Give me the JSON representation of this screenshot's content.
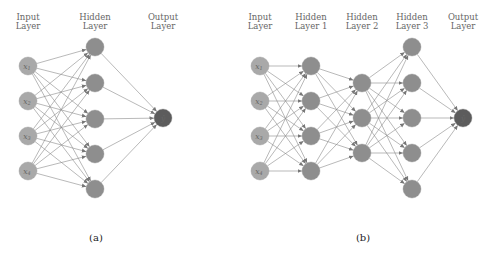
{
  "figure": {
    "panels": [
      {
        "id": "a",
        "caption": "(a)",
        "layers": [
          {
            "name": "input",
            "label_line1": "Input",
            "label_line2": "Layer",
            "x": 28,
            "ys": [
              66,
              101,
              136,
              171
            ],
            "color": "#a9a9a9",
            "node_labels": [
              "x1",
              "x2",
              "x3",
              "x4"
            ]
          },
          {
            "name": "hidden",
            "label_line1": "Hidden",
            "label_line2": "Layer",
            "x": 95,
            "ys": [
              47,
              83,
              119,
              154,
              189
            ],
            "color": "#8e8e8e",
            "node_labels": []
          },
          {
            "name": "output",
            "label_line1": "Output",
            "label_line2": "Layer",
            "x": 163,
            "ys": [
              118
            ],
            "color": "#5c5c5c",
            "node_labels": [
              "ŷ"
            ]
          }
        ]
      },
      {
        "id": "b",
        "caption": "(b)",
        "layers": [
          {
            "name": "input",
            "label_line1": "Input",
            "label_line2": "Layer",
            "x": 260,
            "ys": [
              66,
              101,
              136,
              171
            ],
            "color": "#a9a9a9",
            "node_labels": [
              "x1",
              "x2",
              "x3",
              "x4"
            ]
          },
          {
            "name": "hidden1",
            "label_line1": "Hidden",
            "label_line2": "Layer 1",
            "x": 311,
            "ys": [
              66,
              101,
              136,
              171
            ],
            "color": "#8e8e8e",
            "node_labels": []
          },
          {
            "name": "hidden2",
            "label_line1": "Hidden",
            "label_line2": "Layer 2",
            "x": 362,
            "ys": [
              83,
              118,
              153
            ],
            "color": "#8e8e8e",
            "node_labels": []
          },
          {
            "name": "hidden3",
            "label_line1": "Hidden",
            "label_line2": "Layer 3",
            "x": 412,
            "ys": [
              47,
              83,
              118,
              153,
              189
            ],
            "color": "#8e8e8e",
            "node_labels": []
          },
          {
            "name": "output",
            "label_line1": "Output",
            "label_line2": "Layer",
            "x": 463,
            "ys": [
              118
            ],
            "color": "#5c5c5c",
            "node_labels": [
              "ŷ"
            ]
          }
        ]
      }
    ],
    "node_radius": 9,
    "caption_y": 241,
    "caption_x": {
      "a": 96,
      "b": 363
    },
    "label_y1": 20,
    "label_y2": 29
  }
}
